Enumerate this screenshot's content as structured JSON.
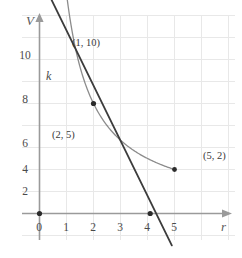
{
  "chart_data": {
    "type": "line",
    "title": "",
    "subtitle": "",
    "xlabel": "r",
    "ylabel": "V",
    "xlim": [
      -0.35,
      6.2
    ],
    "ylim": [
      -1.6,
      11.6
    ],
    "grid": true,
    "legend": "none",
    "x_ticks": [
      "0",
      "1",
      "2",
      "3",
      "4",
      "5"
    ],
    "x_tick_values": [
      0,
      1,
      2,
      3,
      4,
      5
    ],
    "y_ticks": [
      "2",
      "4",
      "6",
      "8",
      "10"
    ],
    "y_tick_values": [
      2,
      4,
      6,
      8,
      10
    ],
    "series": [
      {
        "name": "curve",
        "kind": "hyperbola",
        "equation": "V = 10 / r",
        "color": "#8c8c8c",
        "x_range": [
          1,
          5
        ],
        "points": [
          {
            "x": 1,
            "y": 10
          },
          {
            "x": 1.25,
            "y": 8
          },
          {
            "x": 1.5,
            "y": 6.67
          },
          {
            "x": 1.75,
            "y": 5.71
          },
          {
            "x": 2,
            "y": 5
          },
          {
            "x": 2.5,
            "y": 4
          },
          {
            "x": 3,
            "y": 3.33
          },
          {
            "x": 3.5,
            "y": 2.86
          },
          {
            "x": 4,
            "y": 2.5
          },
          {
            "x": 4.5,
            "y": 2.22
          },
          {
            "x": 5,
            "y": 2
          }
        ]
      },
      {
        "name": "tangent-line-k",
        "kind": "line",
        "label": "k",
        "equation": "V = -2.5 r + 10",
        "color": "#3c3c3c",
        "tangent_at": {
          "x": 2,
          "y": 5
        },
        "x_intercept": 4.1,
        "endpoints": [
          {
            "x": 0.45,
            "y": 9.7
          },
          {
            "x": 4.9,
            "y": -1.45
          }
        ]
      }
    ],
    "marked_points": [
      {
        "label": "(1, 10)",
        "x": 1,
        "y": 10,
        "label_dx": 6,
        "label_dy": -4
      },
      {
        "label": "(2, 5)",
        "x": 2,
        "y": 5,
        "label_dx": -42,
        "label_dy": 0
      },
      {
        "label": "(5, 2)",
        "x": 5,
        "y": 2,
        "label_dx": 4,
        "label_dy": -13
      }
    ],
    "origin_dot": {
      "x": 0,
      "y": 0
    },
    "intercept_dot": {
      "x": 4.1,
      "y": 0
    },
    "annotations": [
      {
        "text": "k",
        "x": 0.6,
        "y": 8.6
      }
    ],
    "colors": {
      "axis": "#9a9a9a",
      "grid": "#e6e6e6",
      "curve": "#8c8c8c",
      "line": "#3c3c3c",
      "dot": "#2b2b2b",
      "text": "#444444",
      "background": "#ffffff"
    }
  },
  "axis_labels": {
    "y": "V",
    "x": "r"
  },
  "tick_labels": {
    "x": [
      "0",
      "1",
      "2",
      "3",
      "4",
      "5"
    ],
    "y": [
      "10",
      "8",
      "6",
      "4",
      "2"
    ]
  },
  "point_labels": {
    "p1": "(1, 10)",
    "p2": "(2, 5)",
    "p3": "(5, 2)"
  },
  "line_label": "k"
}
